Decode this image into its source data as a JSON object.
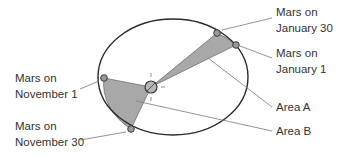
{
  "diagram": {
    "colors": {
      "orbit": "#2a2a2a",
      "area_fill": "#a8a8a8",
      "leader": "#7a7a7a",
      "text": "#333333",
      "planet_fill": "#9a9a9a"
    },
    "labels": {
      "jan30_line1": "Mars on",
      "jan30_line2": "January 30",
      "jan1_line1": "Mars on",
      "jan1_line2": "January 1",
      "area_a": "Area A",
      "area_b": "Area B",
      "nov1_line1": "Mars on",
      "nov1_line2": "November 1",
      "nov30_line1": "Mars on",
      "nov30_line2": "November 30"
    },
    "nodes": [
      {
        "id": "sun",
        "label": "Sun (focus)"
      },
      {
        "id": "mars-nov1",
        "label": "Mars on November 1"
      },
      {
        "id": "mars-nov30",
        "label": "Mars on November 30"
      },
      {
        "id": "mars-jan1",
        "label": "Mars on January 1"
      },
      {
        "id": "mars-jan30",
        "label": "Mars on January 30"
      }
    ],
    "regions": [
      {
        "id": "area-a",
        "label": "Area A",
        "bounded_by": [
          "sun",
          "mars-jan1",
          "mars-jan30"
        ]
      },
      {
        "id": "area-b",
        "label": "Area B",
        "bounded_by": [
          "sun",
          "mars-nov1",
          "mars-nov30"
        ]
      }
    ]
  }
}
